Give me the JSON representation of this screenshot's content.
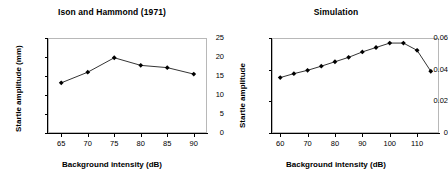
{
  "chart_data": [
    {
      "type": "line",
      "title": "Ison and Hammond (1971)",
      "xlabel": "Background intensity (dB)",
      "ylabel": "Startle amplitude (mm)",
      "x": [
        65,
        70,
        75,
        80,
        85,
        90
      ],
      "values": [
        13.2,
        16.0,
        19.8,
        17.8,
        17.2,
        15.5
      ],
      "xticks": [
        65,
        70,
        75,
        80,
        85,
        90
      ],
      "yticks": [
        0,
        5,
        10,
        15,
        20,
        25
      ],
      "xtick_labels": [
        "65",
        "70",
        "75",
        "80",
        "85",
        "90"
      ],
      "ytick_labels": [
        "0",
        "5",
        "10",
        "15",
        "20",
        "25"
      ],
      "xlim": [
        62.5,
        92.5
      ],
      "ylim": [
        0,
        25
      ],
      "grid": false,
      "legend": "none",
      "marker": "diamond",
      "line_color": "#000000"
    },
    {
      "type": "line",
      "title": "Simulation",
      "xlabel": "Background intensity (dB)",
      "ylabel": "Startle amplitude",
      "x": [
        60,
        65,
        70,
        75,
        80,
        85,
        90,
        95,
        100,
        105,
        110,
        115
      ],
      "values": [
        0.035,
        0.0375,
        0.0396,
        0.0422,
        0.045,
        0.0478,
        0.0512,
        0.054,
        0.0568,
        0.0568,
        0.0522,
        0.039
      ],
      "xticks": [
        60,
        70,
        80,
        90,
        100,
        110
      ],
      "yticks": [
        0,
        0.02,
        0.04,
        0.06
      ],
      "xtick_labels": [
        "60",
        "70",
        "80",
        "90",
        "100",
        "110"
      ],
      "ytick_labels": [
        "0",
        "0.02",
        "0.04",
        "0.06"
      ],
      "xlim": [
        57,
        118
      ],
      "ylim": [
        0,
        0.06
      ],
      "grid": false,
      "legend": "none",
      "marker": "diamond",
      "line_color": "#000000"
    }
  ]
}
